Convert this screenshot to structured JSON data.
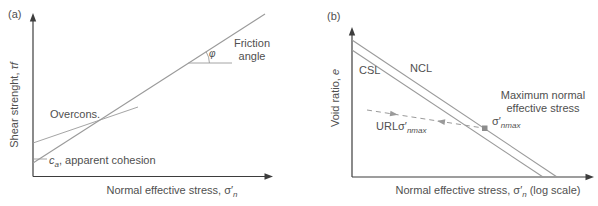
{
  "figure": {
    "panel_a": {
      "tag": "(a)",
      "y_axis": {
        "label": "Shear strenght, ",
        "symbol": "τ",
        "symbol_suffix": "f"
      },
      "x_axis": {
        "label": "Normal effective stress, ",
        "symbol": "σ′",
        "subscript": "n"
      },
      "overconsolidated_label": "Overcons.",
      "cohesion": {
        "symbol": "c",
        "subscript": "a",
        "text": ", apparent cohesion"
      },
      "friction": {
        "angle_symbol": "φ",
        "label_line1": "Friction",
        "label_line2": "angle"
      }
    },
    "panel_b": {
      "tag": "(b)",
      "y_axis": {
        "label": "Void ratio, ",
        "symbol": "e"
      },
      "x_axis": {
        "label": "Normal effective stress, ",
        "symbol": "σ′",
        "subscript": "n",
        "suffix": " (log scale)"
      },
      "csl_label": "CSL",
      "ncl_label": "NCL",
      "url": {
        "prefix": "URL",
        "symbol": "σ′",
        "subscript": "nmax"
      },
      "sigma_max": {
        "symbol": "σ′",
        "subscript": "nmax"
      },
      "max_stress": {
        "line1": "Maximum normal",
        "line2": "effective stress"
      }
    },
    "colors": {
      "axis": "#3d3d3d",
      "line": "#9a9a9a",
      "text": "#4f4f4f",
      "marker": "#8c8c8c"
    }
  }
}
